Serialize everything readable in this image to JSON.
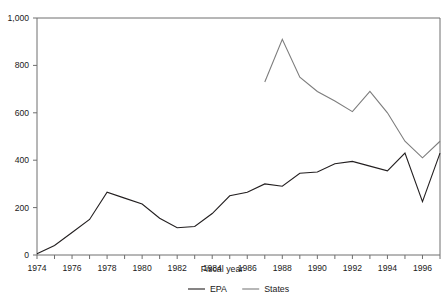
{
  "chart_data": {
    "type": "line",
    "title": "",
    "xlabel": "Fiscal year",
    "ylabel": "",
    "xlim": [
      1974,
      1997
    ],
    "ylim": [
      0,
      1000
    ],
    "grid": false,
    "legend_position": "bottom",
    "x": [
      1974,
      1975,
      1976,
      1977,
      1978,
      1979,
      1980,
      1981,
      1982,
      1983,
      1984,
      1985,
      1986,
      1987,
      1988,
      1989,
      1990,
      1991,
      1992,
      1993,
      1994,
      1995,
      1996,
      1997
    ],
    "x_tick_labels": [
      "1974",
      "1976",
      "1978",
      "1980",
      "1982",
      "1984",
      "1986",
      "1988",
      "1990",
      "1992",
      "1994",
      "1996"
    ],
    "x_tick_values": [
      1974,
      1976,
      1978,
      1980,
      1982,
      1984,
      1986,
      1988,
      1990,
      1992,
      1994,
      1996
    ],
    "y_tick_labels": [
      "0",
      "200",
      "400",
      "600",
      "800",
      "1,000"
    ],
    "y_tick_values": [
      0,
      200,
      400,
      600,
      800,
      1000
    ],
    "series": [
      {
        "name": "EPA",
        "color": "#231f20",
        "x": [
          1974,
          1975,
          1976,
          1977,
          1978,
          1979,
          1980,
          1981,
          1982,
          1983,
          1984,
          1985,
          1986,
          1987,
          1988,
          1989,
          1990,
          1991,
          1992,
          1993,
          1994,
          1995,
          1996,
          1997
        ],
        "values": [
          5,
          40,
          95,
          150,
          265,
          240,
          215,
          155,
          115,
          120,
          175,
          250,
          265,
          300,
          290,
          345,
          350,
          385,
          395,
          375,
          355,
          430,
          225,
          430
        ]
      },
      {
        "name": "States",
        "color": "#7d7d7d",
        "x": [
          1987,
          1988,
          1989,
          1990,
          1991,
          1992,
          1993,
          1994,
          1995,
          1996,
          1997
        ],
        "values": [
          730,
          910,
          750,
          690,
          650,
          605,
          690,
          600,
          480,
          410,
          480
        ]
      }
    ]
  },
  "legend": {
    "items": [
      {
        "label": "EPA",
        "color": "#231f20"
      },
      {
        "label": "States",
        "color": "#7d7d7d"
      }
    ]
  },
  "axis": {
    "x_title": "Fiscal year"
  }
}
